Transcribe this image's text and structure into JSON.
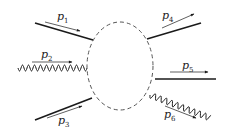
{
  "diagram": {
    "type": "scattering-blob",
    "colors": {
      "line": "#1a1a1a",
      "blob": "#555555",
      "arrow": "#1a1a1a"
    },
    "blob": {
      "cx": 120,
      "cy": 66,
      "rx": 33,
      "ry": 44,
      "style": "dashed"
    },
    "legs": [
      {
        "id": "p1",
        "kind": "fermion",
        "direction": "incoming",
        "label": "p",
        "sub": "1",
        "line": [
          35,
          23,
          93,
          40
        ],
        "arrow": [
          45,
          22,
          80,
          31
        ],
        "label_pos": [
          57,
          20
        ]
      },
      {
        "id": "p2",
        "kind": "photon",
        "direction": "incoming",
        "label": "p",
        "sub": "2",
        "line": [
          18,
          68,
          87,
          68
        ],
        "arrow": [
          32,
          62,
          72,
          62
        ],
        "label_pos": [
          41,
          58
        ]
      },
      {
        "id": "p3",
        "kind": "fermion",
        "direction": "incoming",
        "label": "p",
        "sub": "3",
        "line": [
          35,
          120,
          92,
          98
        ],
        "arrow": [
          47,
          118,
          82,
          106
        ],
        "label_pos": [
          58,
          124
        ]
      },
      {
        "id": "p4",
        "kind": "fermion",
        "direction": "outgoing",
        "label": "p",
        "sub": "4",
        "line": [
          147,
          39,
          201,
          23
        ],
        "arrow": [
          162,
          28,
          194,
          14
        ],
        "label_pos": [
          162,
          19
        ]
      },
      {
        "id": "p5",
        "kind": "fermion",
        "direction": "outgoing",
        "label": "p",
        "sub": "5",
        "line": [
          155,
          79,
          216,
          79
        ],
        "arrow": [
          170,
          72,
          208,
          72
        ],
        "label_pos": [
          182,
          69
        ]
      },
      {
        "id": "p6",
        "kind": "photon",
        "direction": "outgoing",
        "label": "p",
        "sub": "6",
        "line": [
          150,
          95,
          210,
          118
        ],
        "arrow": [
          165,
          106,
          196,
          118
        ],
        "label_pos": [
          164,
          118
        ]
      }
    ]
  }
}
